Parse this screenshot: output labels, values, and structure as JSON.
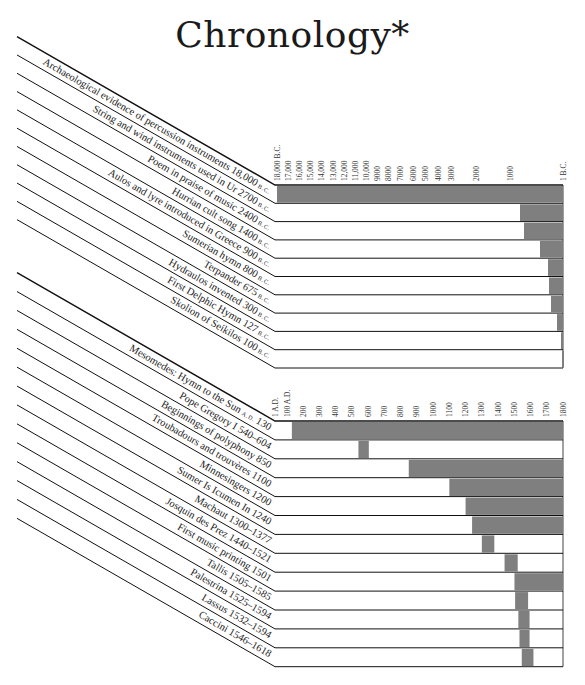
{
  "title": "Chronology*",
  "colors": {
    "bar": "#7f7f7f",
    "line": "#111111",
    "background": "#ffffff"
  },
  "chart_data": [
    {
      "type": "bar",
      "subtype": "timeline-gantt",
      "title": "Chronology* (B.C. period)",
      "axis": {
        "ticks": [
          "18,000 B.C.",
          "17,000",
          "16,000",
          "15,000",
          "14,000",
          "13,000",
          "12,000",
          "11,000",
          "10,000",
          "9000",
          "8000",
          "7000",
          "6000",
          "5000",
          "4000",
          "3000",
          "2000",
          "1000",
          "1 B.C."
        ],
        "tick_x": [
          277,
          288,
          299,
          310,
          321,
          333,
          344,
          355,
          366,
          377,
          388,
          400,
          413,
          425,
          438,
          451,
          476,
          510,
          563
        ],
        "range": [
          -18000,
          -1
        ]
      },
      "events": [
        {
          "label": "Archaeological evidence of percussion instruments",
          "date": "18,000",
          "era": "B.C.",
          "start": -18000,
          "end": -1,
          "bar_x": [
            277,
            563
          ]
        },
        {
          "label": "String and wind instruments used in Ur",
          "date": "2700",
          "era": "B.C.",
          "start": -2700,
          "end": -1,
          "bar_x": [
            520,
            563
          ]
        },
        {
          "label": "Poem in praise of music",
          "date": "2400",
          "era": "B.C.",
          "start": -2400,
          "end": -1,
          "bar_x": [
            524,
            563
          ]
        },
        {
          "label": "Hurrian cult song",
          "date": "1400",
          "era": "B.C.",
          "start": -1400,
          "end": -1,
          "bar_x": [
            540,
            563
          ]
        },
        {
          "label": "Aulos and lyre introduced in Greece",
          "date": "900",
          "era": "B.C.",
          "start": -900,
          "end": -1,
          "bar_x": [
            548,
            563
          ]
        },
        {
          "label": "Sumerian hymn",
          "date": "800",
          "era": "B.C.",
          "start": -800,
          "end": -1,
          "bar_x": [
            549,
            563
          ]
        },
        {
          "label": "Terpander",
          "date": "675",
          "era": "B.C.",
          "start": -675,
          "end": -1,
          "bar_x": [
            551,
            563
          ]
        },
        {
          "label": "Hydraulos invented",
          "date": "300",
          "era": "B.C.",
          "start": -300,
          "end": -1,
          "bar_x": [
            557,
            563
          ]
        },
        {
          "label": "First Delphic Hymn",
          "date": "127",
          "era": "B.C.",
          "start": -127,
          "end": -1,
          "bar_x": [
            561,
            563
          ]
        },
        {
          "label": "Skolion of Seikilos",
          "date": "100",
          "era": "B.C.",
          "start": -100,
          "end": -1,
          "bar_x": [
            562,
            563
          ]
        }
      ]
    },
    {
      "type": "bar",
      "subtype": "timeline-gantt",
      "title": "Chronology* (A.D. period)",
      "axis": {
        "ticks": [
          "1 A.D.",
          "100 A.D.",
          "200",
          "300",
          "400",
          "500",
          "600",
          "700",
          "800",
          "900",
          "1000",
          "1100",
          "1200",
          "1300",
          "1400",
          "1500",
          "1600",
          "1700",
          "1800"
        ],
        "range": [
          1,
          1800
        ]
      },
      "events": [
        {
          "label": "Mesomedes: Hymn to the Sun",
          "era": "A.D.",
          "date": "130",
          "start": 130,
          "end": 1800
        },
        {
          "label": "Pope Gregory I",
          "date": "540–604",
          "start": 540,
          "end": 604
        },
        {
          "label": "Beginnings of polyphony",
          "date": "850",
          "start": 850,
          "end": 1800
        },
        {
          "label": "Troubadours and trouvères",
          "date": "1100",
          "start": 1100,
          "end": 1800
        },
        {
          "label": "Minnesingers",
          "date": "1200",
          "start": 1200,
          "end": 1800
        },
        {
          "label": "Sumer Is Icumen In",
          "date": "1240",
          "start": 1240,
          "end": 1800
        },
        {
          "label": "Machaut",
          "date": "1300–1377",
          "start": 1300,
          "end": 1377
        },
        {
          "label": "Josquin des Prez",
          "date": "1440–1521",
          "start": 1440,
          "end": 1521
        },
        {
          "label": "First music printing",
          "date": "1501",
          "start": 1501,
          "end": 1800
        },
        {
          "label": "Tallis",
          "date": "1505–1585",
          "start": 1505,
          "end": 1585
        },
        {
          "label": "Palestrina",
          "date": "1525–1594",
          "start": 1525,
          "end": 1594
        },
        {
          "label": "Lassus",
          "date": "1532–1594",
          "start": 1532,
          "end": 1594
        },
        {
          "label": "Caccini",
          "date": "1546–1618",
          "start": 1546,
          "end": 1618
        }
      ]
    }
  ]
}
